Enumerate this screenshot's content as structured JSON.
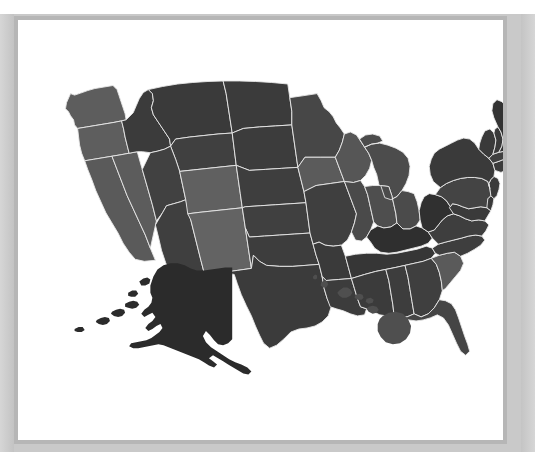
{
  "figure": {
    "kind": "choropleth-map",
    "region": "United States",
    "frame_color": "#b6b6b6",
    "mat_color": "#c9c9c9",
    "panel_background": "#ffffff",
    "border_color": "#e9e9e9"
  },
  "palette": {
    "lightest": "#6b6b6b",
    "light": "#5f5f5f",
    "mid_light": "#565656",
    "mid": "#4b4b4b",
    "mid_dark": "#424242",
    "dark": "#3a3a3a",
    "darker": "#333333",
    "darkest": "#2b2b2b"
  },
  "chart_data": {
    "type": "map",
    "title": "",
    "subtitle": "",
    "xlabel": "",
    "ylabel": "",
    "legend": [],
    "grid": false,
    "projection": "albers-usa",
    "value_scale": "grayscale",
    "categories": [
      "Alabama",
      "Alaska",
      "Arizona",
      "Arkansas",
      "California",
      "Colorado",
      "Connecticut",
      "Delaware",
      "Florida",
      "Georgia",
      "Hawaii",
      "Idaho",
      "Illinois",
      "Indiana",
      "Iowa",
      "Kansas",
      "Kentucky",
      "Louisiana",
      "Maine",
      "Maryland",
      "Massachusetts",
      "Michigan",
      "Minnesota",
      "Mississippi",
      "Missouri",
      "Montana",
      "Nebraska",
      "Nevada",
      "New Hampshire",
      "New Jersey",
      "New Mexico",
      "New York",
      "North Carolina",
      "North Dakota",
      "Ohio",
      "Oklahoma",
      "Oregon",
      "Pennsylvania",
      "Rhode Island",
      "South Carolina",
      "South Dakota",
      "Tennessee",
      "Texas",
      "Utah",
      "Vermont",
      "Virginia",
      "Washington",
      "West Virginia",
      "Wisconsin",
      "Wyoming"
    ],
    "series": [
      {
        "name": "shade",
        "values": [
          "#3d3d3d",
          "#2b2b2b",
          "#3f3f3f",
          "#3a3a3a",
          "#5a5a5a",
          "#606060",
          "#3c3c3c",
          "#3a3a3a",
          "#454545",
          "#3f3f3f",
          "#4f4f4f",
          "#3b3b3b",
          "#4a4a4a",
          "#4e4e4e",
          "#5b5b5b",
          "#404040",
          "#2f2f2f",
          "#3c3c3c",
          "#333333",
          "#3a3a3a",
          "#404040",
          "#4c4c4c",
          "#474747",
          "#3b3b3b",
          "#3f3f3f",
          "#3a3a3a",
          "#3e3e3e",
          "#5c5c5c",
          "#3a3a3a",
          "#3b3b3b",
          "#636363",
          "#3a3a3a",
          "#3e3e3e",
          "#3b3b3b",
          "#4b4b4b",
          "#3d3d3d",
          "#5e5e5e",
          "#444444",
          "#3a3a3a",
          "#5a5a5a",
          "#3c3c3c",
          "#363636",
          "#3b3b3b",
          "#414141",
          "#3a3a3a",
          "#3e3e3e",
          "#5d5d5d",
          "#303030",
          "#565656",
          "#404040"
        ]
      }
    ]
  },
  "states": [
    {
      "code": "WA",
      "name": "Washington",
      "shade": "#5d5d5d"
    },
    {
      "code": "OR",
      "name": "Oregon",
      "shade": "#5e5e5e"
    },
    {
      "code": "CA",
      "name": "California",
      "shade": "#5a5a5a"
    },
    {
      "code": "NV",
      "name": "Nevada",
      "shade": "#5c5c5c"
    },
    {
      "code": "ID",
      "name": "Idaho",
      "shade": "#3b3b3b"
    },
    {
      "code": "MT",
      "name": "Montana",
      "shade": "#3a3a3a"
    },
    {
      "code": "WY",
      "name": "Wyoming",
      "shade": "#404040"
    },
    {
      "code": "UT",
      "name": "Utah",
      "shade": "#414141"
    },
    {
      "code": "AZ",
      "name": "Arizona",
      "shade": "#3f3f3f"
    },
    {
      "code": "CO",
      "name": "Colorado",
      "shade": "#606060"
    },
    {
      "code": "NM",
      "name": "New Mexico",
      "shade": "#636363"
    },
    {
      "code": "ND",
      "name": "North Dakota",
      "shade": "#3b3b3b"
    },
    {
      "code": "SD",
      "name": "South Dakota",
      "shade": "#3c3c3c"
    },
    {
      "code": "NE",
      "name": "Nebraska",
      "shade": "#3e3e3e"
    },
    {
      "code": "KS",
      "name": "Kansas",
      "shade": "#404040"
    },
    {
      "code": "OK",
      "name": "Oklahoma",
      "shade": "#3d3d3d"
    },
    {
      "code": "TX",
      "name": "Texas",
      "shade": "#3b3b3b"
    },
    {
      "code": "MN",
      "name": "Minnesota",
      "shade": "#474747"
    },
    {
      "code": "IA",
      "name": "Iowa",
      "shade": "#5b5b5b"
    },
    {
      "code": "MO",
      "name": "Missouri",
      "shade": "#3f3f3f"
    },
    {
      "code": "AR",
      "name": "Arkansas",
      "shade": "#3a3a3a"
    },
    {
      "code": "LA",
      "name": "Louisiana",
      "shade": "#3c3c3c"
    },
    {
      "code": "WI",
      "name": "Wisconsin",
      "shade": "#565656"
    },
    {
      "code": "IL",
      "name": "Illinois",
      "shade": "#4a4a4a"
    },
    {
      "code": "MI",
      "name": "Michigan",
      "shade": "#4c4c4c"
    },
    {
      "code": "IN",
      "name": "Indiana",
      "shade": "#4e4e4e"
    },
    {
      "code": "OH",
      "name": "Ohio",
      "shade": "#4b4b4b"
    },
    {
      "code": "KY",
      "name": "Kentucky",
      "shade": "#2f2f2f"
    },
    {
      "code": "TN",
      "name": "Tennessee",
      "shade": "#363636"
    },
    {
      "code": "MS",
      "name": "Mississippi",
      "shade": "#3b3b3b"
    },
    {
      "code": "AL",
      "name": "Alabama",
      "shade": "#3d3d3d"
    },
    {
      "code": "GA",
      "name": "Georgia",
      "shade": "#3f3f3f"
    },
    {
      "code": "FL",
      "name": "Florida",
      "shade": "#454545"
    },
    {
      "code": "SC",
      "name": "South Carolina",
      "shade": "#5a5a5a"
    },
    {
      "code": "NC",
      "name": "North Carolina",
      "shade": "#3e3e3e"
    },
    {
      "code": "VA",
      "name": "Virginia",
      "shade": "#3e3e3e"
    },
    {
      "code": "WV",
      "name": "West Virginia",
      "shade": "#303030"
    },
    {
      "code": "MD",
      "name": "Maryland",
      "shade": "#3a3a3a"
    },
    {
      "code": "DE",
      "name": "Delaware",
      "shade": "#3a3a3a"
    },
    {
      "code": "PA",
      "name": "Pennsylvania",
      "shade": "#444444"
    },
    {
      "code": "NJ",
      "name": "New Jersey",
      "shade": "#3b3b3b"
    },
    {
      "code": "NY",
      "name": "New York",
      "shade": "#3a3a3a"
    },
    {
      "code": "CT",
      "name": "Connecticut",
      "shade": "#3c3c3c"
    },
    {
      "code": "RI",
      "name": "Rhode Island",
      "shade": "#3a3a3a"
    },
    {
      "code": "MA",
      "name": "Massachusetts",
      "shade": "#404040"
    },
    {
      "code": "VT",
      "name": "Vermont",
      "shade": "#3a3a3a"
    },
    {
      "code": "NH",
      "name": "New Hampshire",
      "shade": "#3a3a3a"
    },
    {
      "code": "ME",
      "name": "Maine",
      "shade": "#333333"
    },
    {
      "code": "AK",
      "name": "Alaska",
      "shade": "#2b2b2b"
    },
    {
      "code": "HI",
      "name": "Hawaii",
      "shade": "#4f4f4f"
    }
  ]
}
